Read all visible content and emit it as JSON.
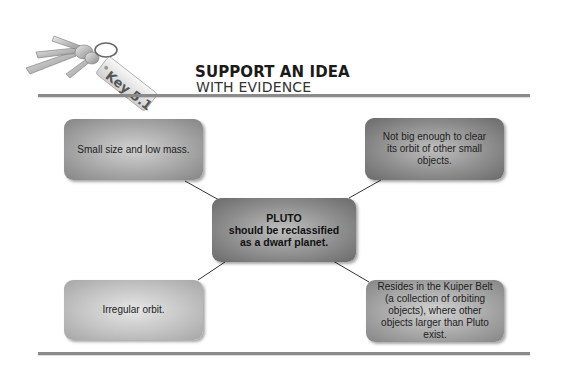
{
  "header": {
    "badge_label": "Key 5.1",
    "title_line1": "SUPPORT AN IDEA",
    "title_line2": "WITH EVIDENCE"
  },
  "diagram": {
    "center": {
      "line1": "PLUTO",
      "line2": "should be reclassified",
      "line3": "as a dwarf planet."
    },
    "evidence": [
      {
        "position": "top-left",
        "text": "Small size and low mass."
      },
      {
        "position": "top-right",
        "text": "Not big enough to clear its orbit of other small objects."
      },
      {
        "position": "bottom-left",
        "text": "Irregular orbit."
      },
      {
        "position": "bottom-right",
        "text": "Resides in the Kuiper Belt (a collection of orbiting objects), where other objects larger than Pluto exist."
      }
    ]
  },
  "icons": {
    "keys": "keys-icon"
  }
}
